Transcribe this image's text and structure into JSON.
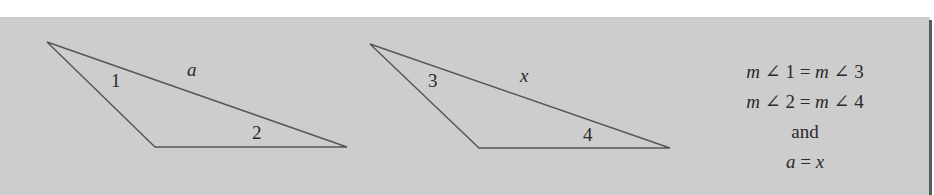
{
  "figure": {
    "background_color": "#cdcdcd",
    "stroke_color": "#555555",
    "triangle_1": {
      "vertices": [
        [
          47,
          42
        ],
        [
          155,
          147
        ],
        [
          347,
          147
        ]
      ],
      "angle_labels": [
        {
          "text": "1",
          "x": 111,
          "y": 87
        },
        {
          "text": "2",
          "x": 252,
          "y": 139
        }
      ],
      "side_label": {
        "text": "a",
        "x": 187,
        "y": 76
      }
    },
    "triangle_2": {
      "vertices": [
        [
          370,
          44
        ],
        [
          479,
          148
        ],
        [
          670,
          148
        ]
      ],
      "angle_labels": [
        {
          "text": "3",
          "x": 428,
          "y": 87
        },
        {
          "text": "4",
          "x": 583,
          "y": 141
        }
      ],
      "side_label": {
        "text": "x",
        "x": 520,
        "y": 82
      }
    }
  },
  "statement": {
    "line1": {
      "m1": "m",
      "angle": "∠",
      "n1": "1",
      "eq": "=",
      "m2": "m",
      "angle2": "∠",
      "n2": "3"
    },
    "line2": {
      "m1": "m",
      "angle": "∠",
      "n1": "2",
      "eq": "=",
      "m2": "m",
      "angle2": "∠",
      "n2": "4"
    },
    "line3": "and",
    "line4": {
      "lhs": "a",
      "eq": "=",
      "rhs": "x"
    }
  }
}
